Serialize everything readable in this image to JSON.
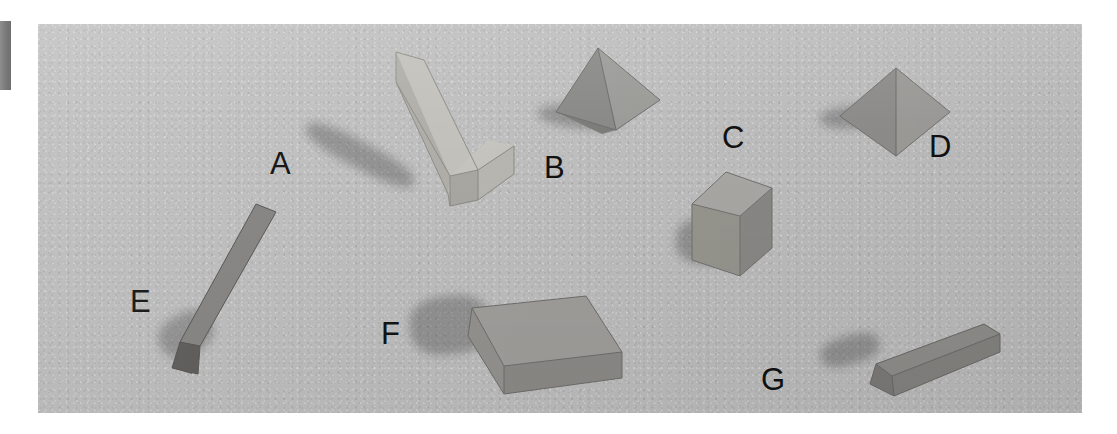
{
  "scene": {
    "kind": "photograph-of-geometric-solids",
    "background_color": "#bfbfbf",
    "page_color": "#ffffff",
    "photo": {
      "left": 38,
      "top": 24,
      "width": 1044,
      "height": 389
    },
    "edge_marker": {
      "color": "#7a7a7a",
      "left": 0,
      "top": 21,
      "width": 11,
      "height": 69
    }
  },
  "labels": [
    {
      "id": "A",
      "text": "A",
      "left": 270,
      "top": 139
    },
    {
      "id": "B",
      "text": "B",
      "left": 544,
      "top": 143
    },
    {
      "id": "C",
      "text": "C",
      "left": 722,
      "top": 113
    },
    {
      "id": "D",
      "text": "D",
      "left": 929,
      "top": 122
    },
    {
      "id": "E",
      "text": "E",
      "left": 130,
      "top": 277
    },
    {
      "id": "F",
      "text": "F",
      "left": 381,
      "top": 309
    },
    {
      "id": "G",
      "text": "G",
      "left": 761,
      "top": 355
    }
  ],
  "objects": [
    {
      "id": "A",
      "name": "long-rectangular-beam",
      "shape": "rectangular prism",
      "color": "#b9b7b2",
      "label": "A"
    },
    {
      "id": "B",
      "name": "square-pyramid",
      "shape": "square pyramid",
      "color": "#8e8e8c",
      "label": "B"
    },
    {
      "id": "C",
      "name": "cube",
      "shape": "cube",
      "color": "#9c9b98",
      "label": "C"
    },
    {
      "id": "D",
      "name": "flat-pyramid-top-view",
      "shape": "square pyramid seen from above",
      "color": "#969593",
      "label": "D"
    },
    {
      "id": "E",
      "name": "triangular-prism",
      "shape": "triangular prism",
      "color": "#7e7e7c",
      "label": "E"
    },
    {
      "id": "F",
      "name": "flat-rectangular-slab",
      "shape": "rectangular prism (slab)",
      "color": "#979694",
      "label": "F"
    },
    {
      "id": "G",
      "name": "thin-long-beam",
      "shape": "rectangular prism (thin beam)",
      "color": "#8d8c8a",
      "label": "G"
    }
  ]
}
